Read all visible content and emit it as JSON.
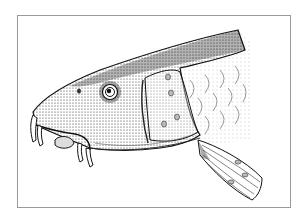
{
  "image": {
    "subject": "Stippled ink illustration of a barbel fish head in side profile",
    "alt": "Pen-and-ink stipple drawing of a fish head with barbels, eye, gill cover and pectoral fin",
    "colors": {
      "background": "#ffffff",
      "frame": "#9a9a9a",
      "ink": "#111111",
      "shade": "#2a2a2a"
    },
    "features": [
      "eye",
      "snout",
      "barbels",
      "lips",
      "gill-cover",
      "scales",
      "pectoral-fin",
      "dorsal-back"
    ]
  }
}
